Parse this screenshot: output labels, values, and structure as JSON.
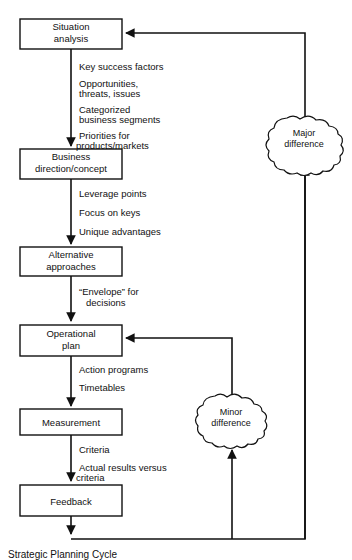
{
  "figure": {
    "title": "Strategic Planning Cycle",
    "caption": "Strategic Planning Cycle"
  },
  "nodes": [
    {
      "id": "situation-analysis",
      "lines": [
        "Situation",
        "analysis"
      ]
    },
    {
      "id": "business-direction",
      "lines": [
        "Business",
        "direction/concept"
      ]
    },
    {
      "id": "alternative-approaches",
      "lines": [
        "Alternative",
        "approaches"
      ]
    },
    {
      "id": "operational-plan",
      "lines": [
        "Operational",
        "plan"
      ]
    },
    {
      "id": "measurement",
      "lines": [
        "Measurement"
      ]
    },
    {
      "id": "feedback",
      "lines": [
        "Feedback"
      ]
    }
  ],
  "clouds": [
    {
      "id": "major-difference",
      "lines": [
        "Major",
        "difference"
      ]
    },
    {
      "id": "minor-difference",
      "lines": [
        "Minor",
        "difference"
      ]
    }
  ],
  "edge_labels": {
    "situation_to_business": [
      "Key success factors",
      "Opportunities,",
      "threats, issues",
      "Categorized",
      "business segments",
      "Priorities for",
      "products/markets"
    ],
    "business_to_alternative": [
      "Leverage points",
      "Focus on keys",
      "Unique advantages"
    ],
    "alternative_to_operational": [
      "“Envelope” for",
      "decisions"
    ],
    "operational_to_measurement": [
      "Action programs",
      "Timetables"
    ],
    "measurement_to_feedback": [
      "Criteria",
      "Actual results versus",
      "criteria"
    ]
  },
  "colors": {
    "ink": "#111111",
    "paper": "#ffffff"
  }
}
